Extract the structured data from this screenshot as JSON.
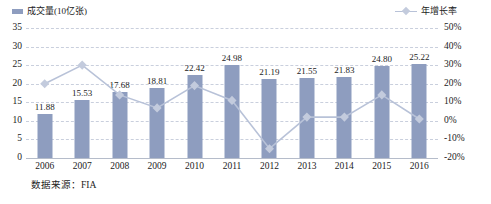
{
  "legend": {
    "bar_series": "成交量(10亿张)",
    "line_series": "年增长率",
    "bar_icon": "legend-square-icon",
    "line_icon": "legend-line-marker-icon"
  },
  "source_note": "数据来源：FIA",
  "colors": {
    "bar": "#8e9dbf",
    "line": "#b8c2d8",
    "marker": "#c3cbdd",
    "gridline": "#c9cfdd",
    "text": "#1c1c1c"
  },
  "chart_data": {
    "type": "bar",
    "title": "",
    "xlabel": "",
    "ylabel": "成交量(10亿张)",
    "y2label": "年增长率",
    "grid": true,
    "legend_position": "top",
    "categories": [
      "2006",
      "2007",
      "2008",
      "2009",
      "2010",
      "2011",
      "2012",
      "2013",
      "2014",
      "2015",
      "2016"
    ],
    "ylim": [
      0,
      35
    ],
    "yticks": [
      "0",
      "5",
      "10",
      "15",
      "20",
      "25",
      "30",
      "35"
    ],
    "y2lim": [
      -20,
      50
    ],
    "y2ticks": [
      "-20%",
      "-10%",
      "0%",
      "10%",
      "20%",
      "30%",
      "40%",
      "50%"
    ],
    "series": [
      {
        "name": "成交量(10亿张)",
        "type": "bar",
        "axis": "left",
        "values": [
          11.88,
          15.53,
          17.68,
          18.81,
          22.42,
          24.98,
          21.19,
          21.55,
          21.83,
          24.8,
          25.22
        ],
        "labels": [
          "11.88",
          "15.53",
          "17.68",
          "18.81",
          "22.42",
          "24.98",
          "21.19",
          "21.55",
          "21.83",
          "24.80",
          "25.22"
        ]
      },
      {
        "name": "年增长率",
        "type": "line",
        "axis": "right",
        "values": [
          20,
          30,
          14,
          7,
          19,
          11,
          -15,
          2,
          2,
          14,
          1
        ]
      }
    ]
  }
}
